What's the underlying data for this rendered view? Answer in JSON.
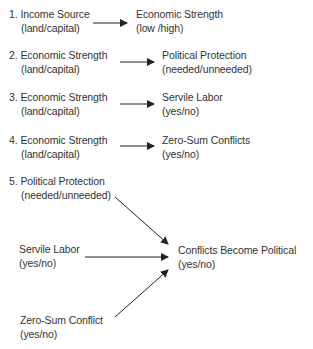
{
  "diagram": {
    "rows": [
      {
        "num": "1.",
        "left_title": "Income Source",
        "left_sub": "(land/capital)",
        "right_title": "Economic Strength",
        "right_sub": "(low  /high)"
      },
      {
        "num": "2.",
        "left_title": "Economic Strength",
        "left_sub": "(land/capital)",
        "right_title": "Political Protection",
        "right_sub": "(needed/unneeded)"
      },
      {
        "num": "3.",
        "left_title": "Economic Strength",
        "left_sub": "(land/capital)",
        "right_title": "Servile Labor",
        "right_sub": "(yes/no)"
      },
      {
        "num": "4.",
        "left_title": "Economic Strength",
        "left_sub": "(land/capital)",
        "right_title": "Zero-Sum Conflicts",
        "right_sub": "(yes/no)"
      }
    ],
    "row5": {
      "num": "5.",
      "inputs": [
        {
          "title": "Political Protection",
          "sub": "(needed/unneeded)"
        },
        {
          "title": "Servile Labor",
          "sub": "(yes/no)"
        },
        {
          "title": "Zero-Sum Conflict",
          "sub": "(yes/no)"
        }
      ],
      "output": {
        "title": "Conflicts Become Political",
        "sub": "(yes/no)"
      }
    },
    "colors": {
      "text": "#333333",
      "arrow": "#222222"
    }
  }
}
